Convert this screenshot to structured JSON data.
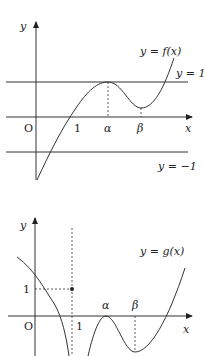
{
  "figure": {
    "top_graph": {
      "y_axis_label": "y",
      "x_axis_label": "x",
      "origin_label": "O",
      "curve_label": "y = f(x)",
      "line_upper_label": "y = 1",
      "line_lower_label": "y = −1",
      "tick_labels": [
        "1",
        "α",
        "β"
      ]
    },
    "bottom_graph": {
      "y_axis_label": "y",
      "x_axis_label": "x",
      "origin_label": "O",
      "curve_label": "y = g(x)",
      "y_tick_label": "1",
      "x_tick_label": "1",
      "point_labels": [
        "α",
        "β"
      ]
    },
    "colors": {
      "stroke": "#333333",
      "background": "#ffffff"
    }
  }
}
